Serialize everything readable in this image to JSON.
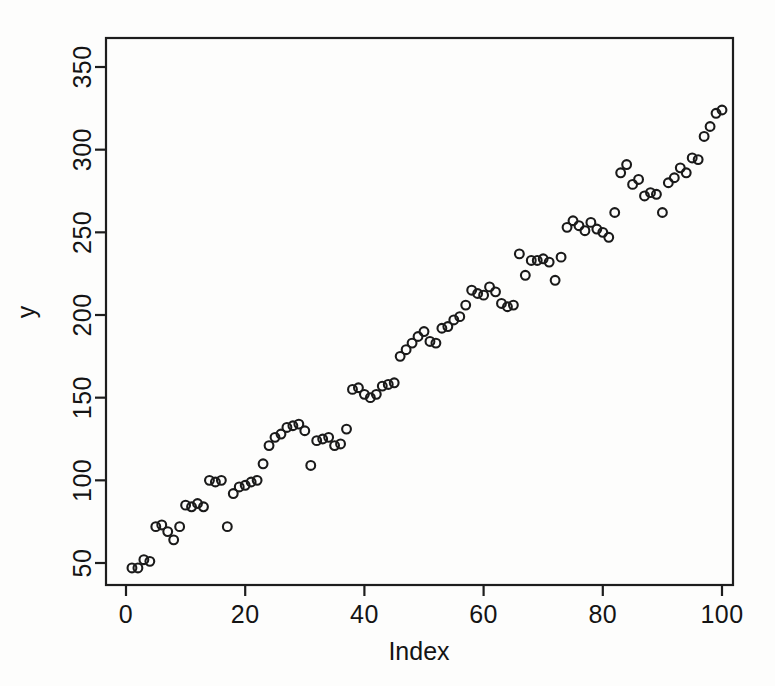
{
  "chart_data": {
    "type": "scatter",
    "title": "",
    "xlabel": "Index",
    "ylabel": "y",
    "xlim": [
      0,
      101
    ],
    "ylim": [
      40,
      372
    ],
    "xticks": [
      0,
      20,
      40,
      60,
      80,
      100
    ],
    "xticklabels": [
      "0",
      "20",
      "40",
      "60",
      "80",
      "100"
    ],
    "yticks": [
      50,
      100,
      150,
      200,
      250,
      300,
      350
    ],
    "yticklabels": [
      "50",
      "100",
      "150",
      "200",
      "250",
      "300",
      "350"
    ],
    "grid": false,
    "legend": null,
    "marker": "open-circle",
    "marker_color": "#1a1a1a",
    "x": [
      1,
      2,
      3,
      4,
      5,
      6,
      7,
      8,
      9,
      10,
      11,
      12,
      13,
      14,
      15,
      16,
      17,
      18,
      19,
      20,
      21,
      22,
      23,
      24,
      25,
      26,
      27,
      28,
      29,
      30,
      31,
      32,
      33,
      34,
      35,
      36,
      37,
      38,
      39,
      40,
      41,
      42,
      43,
      44,
      45,
      46,
      47,
      48,
      49,
      50,
      51,
      52,
      53,
      54,
      55,
      56,
      57,
      58,
      59,
      60,
      61,
      62,
      63,
      64,
      65,
      66,
      67,
      68,
      69,
      70,
      71,
      72,
      73,
      74,
      75,
      76,
      77,
      78,
      79,
      80,
      81,
      82,
      83,
      84,
      85,
      86,
      87,
      88,
      89,
      90,
      91,
      92,
      93,
      94,
      95,
      96,
      97,
      98,
      99,
      100
    ],
    "y": [
      47,
      47,
      52,
      51,
      72,
      73,
      69,
      64,
      72,
      85,
      84,
      86,
      84,
      100,
      99,
      100,
      72,
      92,
      96,
      97,
      99,
      100,
      110,
      121,
      126,
      128,
      132,
      133,
      134,
      130,
      109,
      124,
      125,
      126,
      121,
      122,
      131,
      155,
      156,
      152,
      150,
      152,
      157,
      158,
      159,
      175,
      179,
      183,
      187,
      190,
      184,
      183,
      192,
      193,
      197,
      199,
      206,
      215,
      213,
      212,
      217,
      214,
      207,
      205,
      206,
      237,
      224,
      233,
      233,
      234,
      232,
      221,
      235,
      253,
      257,
      254,
      251,
      256,
      252,
      250,
      247,
      262,
      286,
      291,
      279,
      282,
      272,
      274,
      273,
      262,
      280,
      283,
      289,
      286,
      295,
      294,
      308,
      314,
      322,
      324
    ],
    "series_note": "Approximately linear increasing trend with scatter",
    "n_points": 100
  },
  "axes": {
    "x_title": "Index",
    "y_title": "y"
  }
}
